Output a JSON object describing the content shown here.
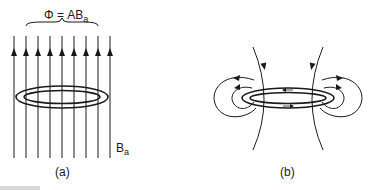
{
  "figure": {
    "panel_a": {
      "flux_label": "Φ = AB",
      "flux_subscript": "a",
      "field_label": "B",
      "field_subscript": "a",
      "caption": "(a)"
    },
    "panel_b": {
      "caption": "(b)"
    },
    "colors": {
      "line": "#1a1a1a",
      "background": "#ffffff"
    }
  }
}
